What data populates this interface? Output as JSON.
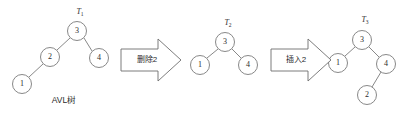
{
  "figure": {
    "width": 409,
    "height": 117,
    "background": "#ffffff",
    "stroke_color": "#7a7a7a",
    "text_color": "#2b2b2b",
    "caption": "AVL树"
  },
  "trees": [
    {
      "tag": "T",
      "tag_sub": "1",
      "tag_x": 80,
      "tag_y": 14,
      "nodes": [
        {
          "label": "3",
          "cx": 77,
          "cy": 31,
          "r": 9.5
        },
        {
          "label": "2",
          "cx": 50,
          "cy": 57,
          "r": 9.5
        },
        {
          "label": "4",
          "cx": 99,
          "cy": 58,
          "r": 9.5
        },
        {
          "label": "1",
          "cx": 22,
          "cy": 84,
          "r": 9.5
        }
      ],
      "edges": [
        {
          "x1": 70,
          "y1": 38,
          "x2": 57,
          "y2": 50
        },
        {
          "x1": 84,
          "y1": 38,
          "x2": 92,
          "y2": 51
        },
        {
          "x1": 43,
          "y1": 64,
          "x2": 29,
          "y2": 77
        }
      ]
    },
    {
      "tag": "T",
      "tag_sub": "2",
      "tag_x": 228,
      "tag_y": 25,
      "nodes": [
        {
          "label": "3",
          "cx": 225,
          "cy": 42,
          "r": 9.5
        },
        {
          "label": "1",
          "cx": 200,
          "cy": 65,
          "r": 9.5
        },
        {
          "label": "4",
          "cx": 248,
          "cy": 65,
          "r": 9.5
        }
      ],
      "edges": [
        {
          "x1": 218,
          "y1": 49,
          "x2": 207,
          "y2": 58
        },
        {
          "x1": 232,
          "y1": 49,
          "x2": 241,
          "y2": 58
        }
      ]
    },
    {
      "tag": "T",
      "tag_sub": "3",
      "tag_x": 365,
      "tag_y": 22,
      "nodes": [
        {
          "label": "3",
          "cx": 362,
          "cy": 40,
          "r": 9.5
        },
        {
          "label": "1",
          "cx": 338,
          "cy": 63,
          "r": 9.5
        },
        {
          "label": "4",
          "cx": 386,
          "cy": 64,
          "r": 9.5
        },
        {
          "label": "2",
          "cx": 367,
          "cy": 95,
          "r": 9.5
        }
      ],
      "edges": [
        {
          "x1": 355,
          "y1": 47,
          "x2": 345,
          "y2": 56
        },
        {
          "x1": 369,
          "y1": 47,
          "x2": 379,
          "y2": 57
        },
        {
          "x1": 381,
          "y1": 72,
          "x2": 372,
          "y2": 87
        }
      ]
    }
  ],
  "arrows": [
    {
      "label": "删除2",
      "label_x": 147,
      "label_y": 60,
      "body_x": 121,
      "body_y": 49,
      "body_w": 37,
      "body_h": 22,
      "head_x": 158,
      "head_tip_x": 181,
      "head_top_y": 39,
      "head_bottom_y": 81
    },
    {
      "label": "插入2",
      "label_x": 296,
      "label_y": 60,
      "body_x": 271,
      "body_y": 49,
      "body_w": 37,
      "body_h": 22,
      "head_x": 308,
      "head_tip_x": 331,
      "head_top_y": 39,
      "head_bottom_y": 81
    }
  ],
  "caption": {
    "text": "AVL树",
    "x": 64,
    "y": 103
  }
}
